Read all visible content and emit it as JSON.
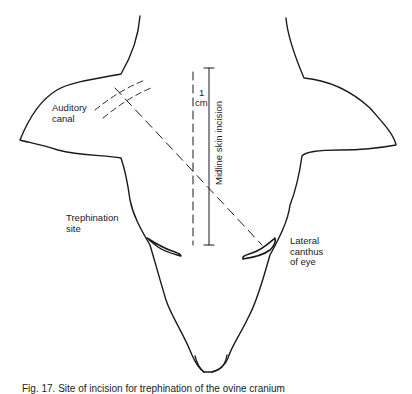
{
  "figure": {
    "labels": {
      "auditory_canal": "Auditory\ncanal",
      "trephination_site": "Trephination\nsite",
      "lateral_canthus": "Lateral\ncanthus\nof eye",
      "midline_incision": "Midline skin incision",
      "scale_1": "1",
      "scale_cm": "cm"
    },
    "caption": "Fig. 17. Site of incision for trephination of the ovine cranium",
    "colors": {
      "ink": "#1a1a1a",
      "background": "#ffffff"
    }
  }
}
